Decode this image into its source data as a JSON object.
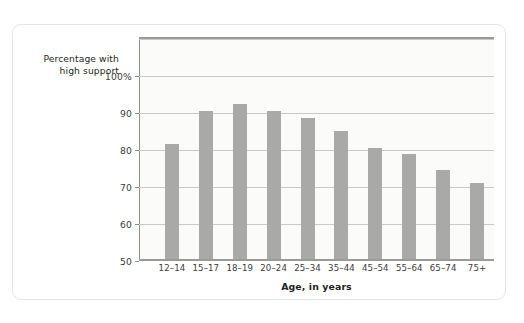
{
  "figure": {
    "background_color": "#ffffff",
    "card_border_color": "#e6e6e4",
    "plot_background_color": "#fbfbfa",
    "bar_color": "#a9a9a8",
    "gridline_color": "#c9c9c7",
    "axis_color": "#9a9a99",
    "text_color": "#231f20"
  },
  "y_axis_title": {
    "line1": "Percentage with",
    "line2": "high support"
  },
  "chart_data": {
    "type": "bar",
    "title": "",
    "subtitle": "",
    "xlabel": "Age, in years",
    "ylabel": "Percentage with high support",
    "categories": [
      "12–14",
      "15–17",
      "18–19",
      "20–24",
      "25–34",
      "35–44",
      "45–54",
      "55–64",
      "65–74",
      "75+"
    ],
    "values": [
      81,
      90,
      92,
      90,
      88,
      84.5,
      80,
      78.5,
      74,
      70.5
    ],
    "ylim": [
      50,
      110
    ],
    "ytick_values": [
      50,
      60,
      70,
      80,
      90,
      100
    ],
    "ytick_labels": [
      "50",
      "60",
      "70",
      "80",
      "90",
      "100%"
    ],
    "extra_gridlines": [
      110
    ],
    "grid": true,
    "grid_axis": "y",
    "legend": false,
    "legend_position": "none",
    "orientation": "vertical",
    "bar_color": "#a9a9a8"
  }
}
